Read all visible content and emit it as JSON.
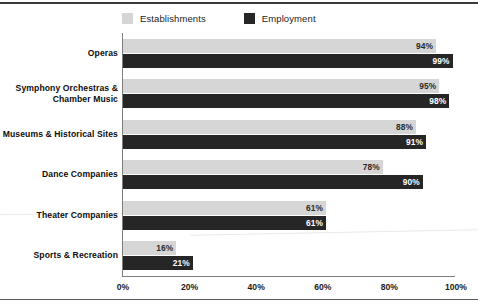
{
  "chart_data": {
    "type": "bar",
    "orientation": "horizontal",
    "title": "",
    "xlabel": "",
    "ylabel": "",
    "xlim": [
      0,
      100
    ],
    "xticks": [
      "0%",
      "20%",
      "40%",
      "60%",
      "80%",
      "100%"
    ],
    "xtick_values": [
      0,
      20,
      40,
      60,
      80,
      100
    ],
    "grid": false,
    "legend_position": "top",
    "categories": [
      "Operas",
      "Symphony Orchestras & Chamber Music",
      "Museums & Historical Sites",
      "Dance Companies",
      "Theater Companies",
      "Sports & Recreation"
    ],
    "series": [
      {
        "name": "Establishments",
        "color": "#d6d6d6",
        "values": [
          94,
          95,
          88,
          78,
          61,
          16
        ],
        "labels": [
          "94%",
          "95%",
          "88%",
          "78%",
          "61%",
          "16%"
        ]
      },
      {
        "name": "Employment",
        "color": "#262626",
        "values": [
          99,
          98,
          91,
          90,
          61,
          21
        ],
        "labels": [
          "99%",
          "98%",
          "91%",
          "90%",
          "61%",
          "21%"
        ]
      }
    ]
  },
  "legend": {
    "items": [
      {
        "label": "Establishments",
        "color": "#d6d6d6"
      },
      {
        "label": "Employment",
        "color": "#262626"
      }
    ]
  },
  "rows": [
    {
      "label": "Operas",
      "label_line1": "Operas",
      "label_line2": ""
    },
    {
      "label": "Symphony Orchestras & Chamber Music",
      "label_line1": "Symphony Orchestras &",
      "label_line2": "Chamber Music"
    },
    {
      "label": "Museums & Historical Sites",
      "label_line1": "Museums & Historical Sites",
      "label_line2": ""
    },
    {
      "label": "Dance Companies",
      "label_line1": "Dance Companies",
      "label_line2": ""
    },
    {
      "label": "Theater Companies",
      "label_line1": "Theater Companies",
      "label_line2": ""
    },
    {
      "label": "Sports & Recreation",
      "label_line1": "Sports & Recreation",
      "label_line2": ""
    }
  ],
  "axis": {
    "ticks": [
      "0%",
      "20%",
      "40%",
      "60%",
      "80%",
      "100%"
    ]
  },
  "colors": {
    "establishments": "#d6d6d6",
    "employment": "#262626",
    "axis": "#7d7d7d",
    "rule": "#3a3a3a"
  }
}
